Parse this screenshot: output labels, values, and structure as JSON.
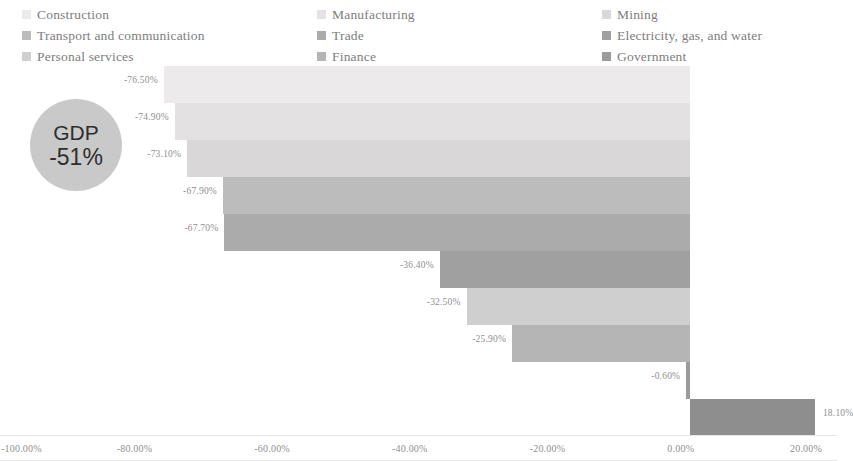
{
  "legend": {
    "items": [
      {
        "label": "Construction",
        "color": "#eceaea"
      },
      {
        "label": "Manufacturing",
        "color": "#e3e1e1"
      },
      {
        "label": "Mining",
        "color": "#d9d7d7"
      },
      {
        "label": "Transport and communication",
        "color": "#bcbcbc"
      },
      {
        "label": "Trade",
        "color": "#ababab"
      },
      {
        "label": "Electricity, gas, and water",
        "color": "#a0a0a0"
      },
      {
        "label": "Personal services",
        "color": "#cfcfcf"
      },
      {
        "label": "Finance",
        "color": "#b5b5b5"
      },
      {
        "label": "Government",
        "color": "#9b9b9b"
      }
    ]
  },
  "gdp_bubble": {
    "title": "GDP",
    "value": "-51%",
    "color": "#c9c9c9"
  },
  "chart_data": {
    "type": "bar",
    "subtype": "waterfall-horizontal",
    "title": "",
    "xlabel": "",
    "ylabel": "",
    "xlim": [
      -100,
      20
    ],
    "grid": false,
    "legend_position": "top",
    "axis_ticks": [
      {
        "value": -100,
        "label": "-100.00%"
      },
      {
        "value": -80,
        "label": "-80.00%"
      },
      {
        "value": -60,
        "label": "-60.00%"
      },
      {
        "value": -40,
        "label": "-40.00%"
      },
      {
        "value": -20,
        "label": "-20.00%"
      },
      {
        "value": 0,
        "label": "0.00%"
      },
      {
        "value": 20,
        "label": "20.00%"
      }
    ],
    "categories": [
      "Construction",
      "Manufacturing",
      "Mining",
      "Transport and communication",
      "Trade",
      "Electricity, gas, and water",
      "Personal services",
      "Finance",
      "Government",
      "Government"
    ],
    "values": [
      -76.5,
      -74.9,
      -73.1,
      -67.9,
      -67.7,
      -36.4,
      -32.5,
      -25.9,
      -0.6,
      18.1
    ],
    "labels": [
      "-76.50%",
      "-74.90%",
      "-73.10%",
      "-67.90%",
      "-67.70%",
      "-36.40%",
      "-32.50%",
      "-25.90%",
      "-0.60%",
      "18.10%"
    ],
    "bars": [
      {
        "label": "-76.50%",
        "value": -76.5,
        "color": "#eceaea",
        "start": -76.5,
        "end": 0.0
      },
      {
        "label": "-74.90%",
        "value": -74.9,
        "color": "#e3e1e1",
        "start": -74.9,
        "end": 0.0
      },
      {
        "label": "-73.10%",
        "value": -73.1,
        "color": "#d9d7d7",
        "start": -73.1,
        "end": 0.0
      },
      {
        "label": "-67.90%",
        "value": -67.9,
        "color": "#bcbcbc",
        "start": -67.9,
        "end": 0.0
      },
      {
        "label": "-67.70%",
        "value": -67.7,
        "color": "#ababab",
        "start": -67.7,
        "end": 0.0
      },
      {
        "label": "-36.40%",
        "value": -36.4,
        "color": "#a0a0a0",
        "start": -36.4,
        "end": 0.0
      },
      {
        "label": "-32.50%",
        "value": -32.5,
        "color": "#cfcfcf",
        "start": -32.5,
        "end": 0.0
      },
      {
        "label": "-25.90%",
        "value": -25.9,
        "color": "#b5b5b5",
        "start": -25.9,
        "end": 0.0
      },
      {
        "label": "-0.60%",
        "value": -0.6,
        "color": "#9b9b9b",
        "start": -0.6,
        "end": 0.0
      },
      {
        "label": "18.10%",
        "value": 18.1,
        "color": "#8e8e8e",
        "start": 0.0,
        "end": 18.1
      }
    ]
  }
}
